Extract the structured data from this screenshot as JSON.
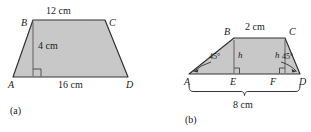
{
  "figure": {
    "background_color": "#ffffff",
    "fill_color": "#c8c8c8",
    "stroke_color": "#333333",
    "panels": [
      {
        "id": "a",
        "caption": "(a)",
        "shape": "trapezoid",
        "vertices": [
          {
            "name": "A",
            "label": "A"
          },
          {
            "name": "B",
            "label": "B"
          },
          {
            "name": "C",
            "label": "C"
          },
          {
            "name": "D",
            "label": "D"
          }
        ],
        "measures": [
          {
            "name": "top-side",
            "label": "12 cm"
          },
          {
            "name": "height",
            "label": "4 cm"
          },
          {
            "name": "base-side",
            "label": "16 cm"
          }
        ],
        "right_angle_marks": 1
      },
      {
        "id": "b",
        "caption": "(b)",
        "shape": "trapezoid",
        "vertices": [
          {
            "name": "A",
            "label": "A"
          },
          {
            "name": "B",
            "label": "B"
          },
          {
            "name": "C",
            "label": "C"
          },
          {
            "name": "D",
            "label": "D"
          },
          {
            "name": "E",
            "label": "E"
          },
          {
            "name": "F",
            "label": "F"
          }
        ],
        "measures": [
          {
            "name": "top-side",
            "label": "2 cm"
          },
          {
            "name": "left-height",
            "label": "h"
          },
          {
            "name": "right-height",
            "label": "h"
          },
          {
            "name": "base-brace",
            "label": "8 cm"
          }
        ],
        "angles": [
          {
            "name": "angle-at-A",
            "label": "45°"
          },
          {
            "name": "angle-at-D",
            "label": "45°"
          }
        ],
        "right_angle_marks": 2
      }
    ]
  }
}
